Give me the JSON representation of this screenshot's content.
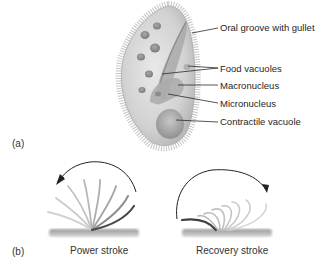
{
  "figure": {
    "panel_a": {
      "label": "(a)",
      "subject": "paramecium-cell",
      "callouts": [
        {
          "text": "Oral groove with gullet"
        },
        {
          "text": "Food vacuoles"
        },
        {
          "text": "Macronucleus"
        },
        {
          "text": "Micronucleus"
        },
        {
          "text": "Contractile vacuole"
        }
      ]
    },
    "panel_b": {
      "label": "(b)",
      "subject": "cilium-beat-cycle",
      "captions": [
        {
          "text": "Power stroke"
        },
        {
          "text": "Recovery stroke"
        }
      ]
    }
  }
}
